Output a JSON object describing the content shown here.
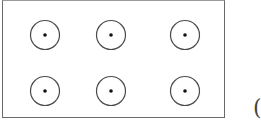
{
  "diagram": {
    "frame": {
      "x": 2,
      "y": 0,
      "width": 223,
      "height": 118,
      "stroke": "#6a6a6a"
    },
    "circle_style": {
      "radius": 14.5,
      "stroke": "#4a4a4a",
      "stroke_width": 1.2,
      "dot_radius": 1.8,
      "dot_color": "#111111"
    },
    "circles": [
      {
        "row": 1,
        "col": 1,
        "cx": 45,
        "cy": 35
      },
      {
        "row": 1,
        "col": 2,
        "cx": 111,
        "cy": 35
      },
      {
        "row": 1,
        "col": 3,
        "cx": 185,
        "cy": 35
      },
      {
        "row": 2,
        "col": 1,
        "cx": 45,
        "cy": 91
      },
      {
        "row": 2,
        "col": 2,
        "cx": 111,
        "cy": 91
      },
      {
        "row": 2,
        "col": 3,
        "cx": 185,
        "cy": 91
      }
    ],
    "label_fragment": "("
  }
}
